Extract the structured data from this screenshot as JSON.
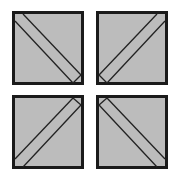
{
  "diagram": {
    "fill_color": "#bcbcbc",
    "stroke_color": "#1a1a1a",
    "tiles": [
      {
        "id": "top-left",
        "orientation": "diagonal-band-descending",
        "cap": "bottom-right"
      },
      {
        "id": "top-right",
        "orientation": "diagonal-band-ascending",
        "cap": "bottom-left"
      },
      {
        "id": "bottom-left",
        "orientation": "diagonal-band-ascending",
        "cap": "top-right"
      },
      {
        "id": "bottom-right",
        "orientation": "diagonal-band-descending",
        "cap": "top-left"
      }
    ]
  }
}
